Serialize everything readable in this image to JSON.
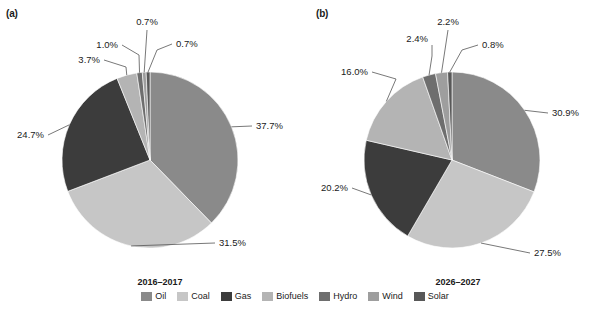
{
  "figure": {
    "panel_a_label": "(a)",
    "panel_b_label": "(b)",
    "source_note": ""
  },
  "legend": {
    "items": [
      {
        "label": "Oil",
        "color": "#8a8a8a"
      },
      {
        "label": "Coal",
        "color": "#c6c6c6"
      },
      {
        "label": "Gas",
        "color": "#3c3c3c"
      },
      {
        "label": "Biofuels",
        "color": "#b4b4b4"
      },
      {
        "label": "Hydro",
        "color": "#6e6e6e"
      },
      {
        "label": "Wind",
        "color": "#9e9e9e"
      },
      {
        "label": "Solar",
        "color": "#585858"
      }
    ]
  },
  "chart_data": [
    {
      "type": "pie",
      "panel": "(a)",
      "title": "2016–2017",
      "categories": [
        "Oil",
        "Coal",
        "Gas",
        "Biofuels",
        "Hydro",
        "Wind",
        "Solar"
      ],
      "values": [
        37.7,
        31.5,
        24.7,
        3.7,
        1.0,
        0.7,
        0.7
      ],
      "labels": [
        "37.7%",
        "31.5%",
        "24.7%",
        "3.7%",
        "1.0%",
        "0.7%",
        "0.7%"
      ],
      "colors": [
        "#8a8a8a",
        "#c6c6c6",
        "#3c3c3c",
        "#b4b4b4",
        "#6e6e6e",
        "#9e9e9e",
        "#585858"
      ],
      "unit": "percent",
      "legend_position": "bottom"
    },
    {
      "type": "pie",
      "panel": "(b)",
      "title": "2026–2027",
      "categories": [
        "Oil",
        "Coal",
        "Gas",
        "Biofuels",
        "Hydro",
        "Wind",
        "Solar"
      ],
      "values": [
        30.9,
        27.5,
        20.2,
        16.0,
        2.4,
        2.2,
        0.8
      ],
      "labels": [
        "30.9%",
        "27.5%",
        "20.2%",
        "16.0%",
        "2.4%",
        "2.2%",
        "0.8%"
      ],
      "colors": [
        "#8a8a8a",
        "#c6c6c6",
        "#3c3c3c",
        "#b4b4b4",
        "#6e6e6e",
        "#9e9e9e",
        "#585858"
      ],
      "unit": "percent",
      "legend_position": "bottom"
    }
  ]
}
